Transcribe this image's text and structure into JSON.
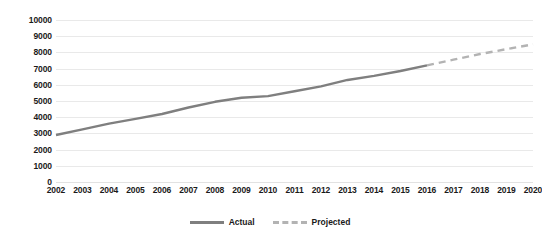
{
  "chart_data": {
    "type": "line",
    "title": "",
    "xlabel": "",
    "ylabel": "",
    "ylim": [
      0,
      10000
    ],
    "ytick_step": 1000,
    "yticks": [
      "10000",
      "9000",
      "8000",
      "7000",
      "6000",
      "5000",
      "4000",
      "3000",
      "2000",
      "1000",
      "0"
    ],
    "ytick_values": [
      10000,
      9000,
      8000,
      7000,
      6000,
      5000,
      4000,
      3000,
      2000,
      1000,
      0
    ],
    "grid": true,
    "grid_axis": "y",
    "legend_position": "bottom-center",
    "categories": [
      "2002",
      "2003",
      "2004",
      "2005",
      "2006",
      "2007",
      "2008",
      "2009",
      "2010",
      "2011",
      "2012",
      "2013",
      "2014",
      "2015",
      "2016",
      "2017",
      "2018",
      "2019",
      "2020"
    ],
    "x": [
      2002,
      2003,
      2004,
      2005,
      2006,
      2007,
      2008,
      2009,
      2010,
      2011,
      2012,
      2013,
      2014,
      2015,
      2016,
      2017,
      2018,
      2019,
      2020
    ],
    "series": [
      {
        "name": "Actual",
        "style": "solid",
        "color": "#7f7f7f",
        "x": [
          2002,
          2003,
          2004,
          2005,
          2006,
          2007,
          2008,
          2009,
          2010,
          2011,
          2012,
          2013,
          2014,
          2015,
          2016
        ],
        "values": [
          2900,
          3250,
          3600,
          3900,
          4200,
          4600,
          4950,
          5200,
          5300,
          5600,
          5900,
          6300,
          6550,
          6850,
          7200
        ]
      },
      {
        "name": "Projected",
        "style": "dashed",
        "color": "#b3b3b3",
        "x": [
          2016,
          2017,
          2018,
          2019,
          2020
        ],
        "values": [
          7200,
          7550,
          7900,
          8200,
          8500
        ]
      }
    ]
  },
  "legend": {
    "entries": [
      {
        "label": "Actual",
        "style": "solid",
        "color": "#7f7f7f"
      },
      {
        "label": "Projected",
        "style": "dashed",
        "color": "#b3b3b3"
      }
    ]
  },
  "colors": {
    "actual": "#7f7f7f",
    "projected": "#b3b3b3",
    "gridline": "#e9e9e9",
    "text": "#1a1a1a",
    "background": "#ffffff"
  }
}
